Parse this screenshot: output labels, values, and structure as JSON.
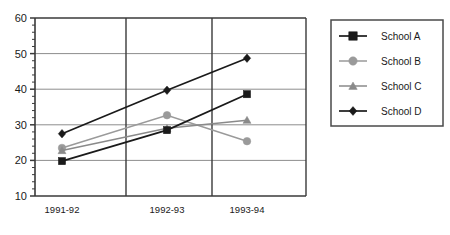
{
  "chart_data": {
    "type": "line",
    "title": "",
    "xlabel": "",
    "ylabel": "",
    "categories": [
      "1991-92",
      "1992-93",
      "1993-94"
    ],
    "ylim": [
      10,
      60
    ],
    "yticks": [
      10,
      20,
      30,
      40,
      50,
      60
    ],
    "ytick_labels": [
      "10",
      "20",
      "30",
      "40",
      "50",
      "60"
    ],
    "minor_tick_step": 2,
    "grid": "both",
    "legend_position": "right",
    "series": [
      {
        "name": "School A",
        "marker": "square",
        "color": "#1a1a1a",
        "values": [
          19.8,
          28.5,
          38.6
        ]
      },
      {
        "name": "School B",
        "marker": "circle",
        "color": "#9a9a9a",
        "values": [
          23.5,
          32.7,
          25.4
        ]
      },
      {
        "name": "School C",
        "marker": "triangle",
        "color": "#8a8a8a",
        "values": [
          22.8,
          29.0,
          31.3
        ]
      },
      {
        "name": "School D",
        "marker": "diamond",
        "color": "#1a1a1a",
        "values": [
          27.5,
          39.7,
          48.7
        ]
      }
    ]
  },
  "legend": {
    "entries": [
      {
        "label": "School A"
      },
      {
        "label": "School B"
      },
      {
        "label": "School C"
      },
      {
        "label": "School D"
      }
    ]
  },
  "colors": {
    "axis": "#3a3a3a",
    "grid": "#8d8d8d",
    "frame": "#3a3a3a",
    "dark_series": "#1a1a1a",
    "gray_series": "#9a9a9a",
    "background": "#ffffff"
  }
}
